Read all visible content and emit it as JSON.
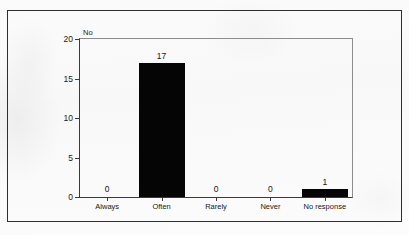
{
  "figure": {
    "caption_fragment": "",
    "y_axis_title": "No"
  },
  "chart_data": {
    "type": "bar",
    "title": "",
    "subtitle": "",
    "xlabel": "",
    "ylabel": "No",
    "categories": [
      "Always",
      "Often",
      "Rarely",
      "Never",
      "No response"
    ],
    "values": [
      0,
      17,
      0,
      0,
      1
    ],
    "data_labels": [
      "0",
      "17",
      "0",
      "0",
      "1"
    ],
    "ylim": [
      0,
      20
    ],
    "y_ticks": [
      0,
      5,
      10,
      15,
      20
    ],
    "y_tick_labels": [
      "0",
      "5",
      "10",
      "15",
      "20"
    ],
    "grid": false,
    "legend": null,
    "bar_color": "#050505",
    "axis_color": "#3a3a3a",
    "frame_color": "#8d8d8d",
    "orientation": "vertical"
  }
}
